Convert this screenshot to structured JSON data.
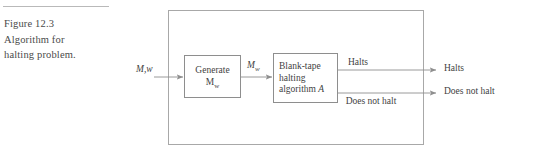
{
  "figure": {
    "caption_lines": [
      "Figure 12.3",
      "Algorithm for",
      "halting problem."
    ],
    "caption_number": "12.3"
  },
  "diagram": {
    "input_label": "M,w",
    "intermediate_label_base": "M",
    "intermediate_label_sub": "w",
    "boxes": [
      {
        "id": "generate",
        "line1": "Generate",
        "line2_base": "M",
        "line2_sub": "w"
      },
      {
        "id": "algorithm",
        "line1": "Blank-tape",
        "line2": "halting",
        "line3_prefix": "algorithm ",
        "line3_italic": "A"
      }
    ],
    "inner_outputs": {
      "halts": "Halts",
      "does_not_halt": "Does not halt"
    },
    "outer_outputs": {
      "halts": "Halts",
      "does_not_halt": "Does not halt"
    }
  },
  "colors": {
    "outer_border": "#a8a8a8",
    "box_border": "#8e8e8e",
    "line": "#8e8e8e",
    "text": "#3f3f3f",
    "caption_text": "#4a4a4a",
    "rule": "#b9b9b9",
    "background": "#ffffff"
  }
}
